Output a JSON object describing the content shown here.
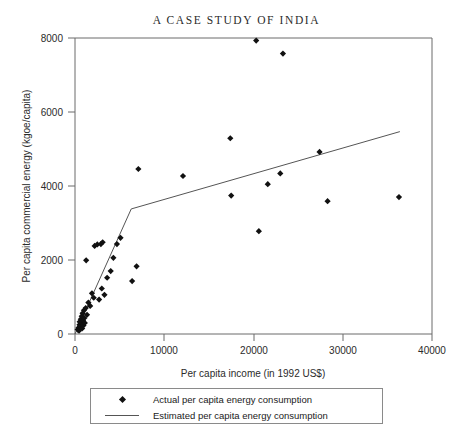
{
  "chart_data": {
    "type": "scatter",
    "title": "A CASE STUDY OF INDIA",
    "xlabel": "Per capita income (in 1992 US$)",
    "ylabel": "Per capita commercial energy (kgoe/capita)",
    "xlim": [
      0,
      40000
    ],
    "ylim": [
      0,
      8000
    ],
    "xticks": [
      0,
      10000,
      20000,
      30000,
      40000
    ],
    "yticks": [
      0,
      2000,
      4000,
      6000,
      8000
    ],
    "xtick_labels": [
      "0",
      "10000",
      "20000",
      "30000",
      "40000"
    ],
    "ytick_labels": [
      "0",
      "2000",
      "4000",
      "6000",
      "8000"
    ],
    "grid": false,
    "legend_position": "below-axes",
    "series": [
      {
        "name": "Actual per capita energy consumption",
        "type": "scatter",
        "marker": "diamond",
        "color": "#111111",
        "points": [
          [
            300,
            120
          ],
          [
            400,
            170
          ],
          [
            450,
            90
          ],
          [
            500,
            250
          ],
          [
            520,
            330
          ],
          [
            600,
            200
          ],
          [
            650,
            400
          ],
          [
            700,
            300
          ],
          [
            750,
            480
          ],
          [
            800,
            150
          ],
          [
            850,
            560
          ],
          [
            900,
            360
          ],
          [
            950,
            230
          ],
          [
            1000,
            640
          ],
          [
            1050,
            430
          ],
          [
            1100,
            300
          ],
          [
            1200,
            700
          ],
          [
            1250,
            1990
          ],
          [
            1350,
            520
          ],
          [
            1500,
            850
          ],
          [
            1700,
            760
          ],
          [
            1900,
            1100
          ],
          [
            2100,
            980
          ],
          [
            2200,
            2380
          ],
          [
            2500,
            2420
          ],
          [
            2700,
            930
          ],
          [
            2900,
            2430
          ],
          [
            3000,
            1230
          ],
          [
            3100,
            2480
          ],
          [
            3300,
            1060
          ],
          [
            3600,
            1520
          ],
          [
            4000,
            1700
          ],
          [
            4300,
            2060
          ],
          [
            4700,
            2430
          ],
          [
            5100,
            2600
          ],
          [
            6400,
            1430
          ],
          [
            6900,
            1830
          ],
          [
            7100,
            4460
          ],
          [
            12100,
            4270
          ],
          [
            17400,
            5290
          ],
          [
            17500,
            3740
          ],
          [
            20300,
            7930
          ],
          [
            20600,
            2780
          ],
          [
            21600,
            4050
          ],
          [
            23000,
            4340
          ],
          [
            23300,
            7580
          ],
          [
            27400,
            4920
          ],
          [
            28300,
            3590
          ],
          [
            36300,
            3700
          ]
        ]
      },
      {
        "name": "Estimated per capita energy consumption",
        "type": "line",
        "color": "#555555",
        "points": [
          [
            0,
            0
          ],
          [
            6300,
            3380
          ],
          [
            36400,
            5470
          ]
        ]
      }
    ]
  },
  "legend": {
    "items": [
      {
        "key": "marker-diamond",
        "label": "Actual per capita energy consumption"
      },
      {
        "key": "line-segment",
        "label": "Estimated per capita energy consumption"
      }
    ]
  }
}
